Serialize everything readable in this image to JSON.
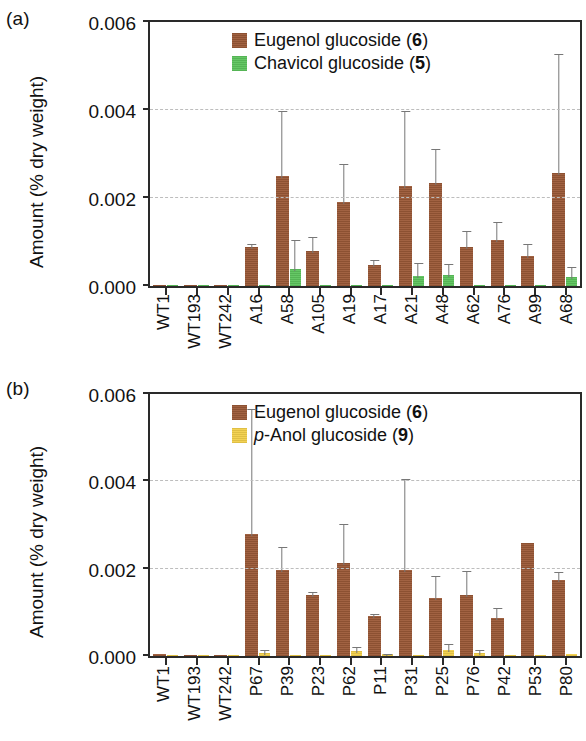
{
  "figure": {
    "panel_a_tag": "(a)",
    "panel_b_tag": "(b)",
    "y_axis_title": "Amount (% dry weight)",
    "x_axis_title": "Lines"
  },
  "chart_data": [
    {
      "type": "bar",
      "panel": "(a)",
      "title": "",
      "xlabel": "",
      "ylabel": "Amount (% dry weight)",
      "ylim": [
        0,
        0.006
      ],
      "yticks": [
        0.0,
        0.002,
        0.004,
        0.006
      ],
      "ytick_labels": [
        "0.000",
        "0.002",
        "0.004",
        "0.006"
      ],
      "grid": true,
      "legend_position": "top-center",
      "categories": [
        "WT1",
        "WT193",
        "WT242",
        "A16",
        "A58",
        "A105",
        "A19",
        "A17",
        "A21",
        "A48",
        "A62",
        "A76",
        "A99",
        "A68"
      ],
      "series": [
        {
          "name": "Eugenol glucoside (6)",
          "color": "#9c5a38",
          "values": [
            2e-05,
            2e-05,
            2e-05,
            0.00088,
            0.0025,
            0.00079,
            0.0019,
            0.00048,
            0.00228,
            0.00234,
            0.00088,
            0.00104,
            0.00069,
            0.00257
          ],
          "errors": [
            0.0,
            0.0,
            0.0,
            0.00012,
            0.00152,
            0.00038,
            0.00093,
            0.00015,
            0.00175,
            0.00083,
            0.00042,
            0.00046,
            0.00031,
            0.00274
          ]
        },
        {
          "name": "Chavicol glucoside (5)",
          "color": "#5cc35c",
          "values": [
            0.0,
            0.0,
            0.0,
            2e-05,
            0.00039,
            2e-05,
            2e-05,
            2e-05,
            0.00022,
            0.00024,
            2e-05,
            2e-05,
            2e-05,
            0.0002
          ],
          "errors": [
            0.0,
            0.0,
            0.0,
            0.0,
            0.0007,
            0.0,
            0.0,
            0.0,
            0.00035,
            0.0003,
            0.0,
            0.0,
            0.0,
            0.00028
          ]
        }
      ]
    },
    {
      "type": "bar",
      "panel": "(b)",
      "title": "",
      "xlabel": "Lines",
      "ylabel": "Amount (% dry weight)",
      "ylim": [
        0,
        0.006
      ],
      "yticks": [
        0.0,
        0.002,
        0.004,
        0.006
      ],
      "ytick_labels": [
        "0.000",
        "0.002",
        "0.004",
        "0.006"
      ],
      "grid": true,
      "legend_position": "top-center",
      "categories": [
        "WT1",
        "WT193",
        "WT242",
        "P67",
        "P39",
        "P23",
        "P62",
        "P11",
        "P31",
        "P25",
        "P76",
        "P42",
        "P53",
        "P80"
      ],
      "series": [
        {
          "name": "Eugenol glucoside (6)",
          "color": "#9c5a38",
          "values": [
            4e-05,
            3e-05,
            3e-05,
            0.00279,
            0.00196,
            0.0014,
            0.00213,
            0.00092,
            0.00196,
            0.00134,
            0.0014,
            0.00088,
            0.00259,
            0.00175
          ],
          "errors": [
            0.0,
            0.0,
            0.0,
            0.00291,
            0.00059,
            0.00012,
            0.00093,
            9e-05,
            0.00213,
            0.00054,
            0.0006,
            0.00026,
            0.0,
            0.00022
          ]
        },
        {
          "name": "p-Anol glucoside (9)",
          "color": "#f2cf4a",
          "values": [
            0.0,
            0.0,
            0.0,
            8e-05,
            3e-05,
            2e-05,
            0.00012,
            5e-05,
            2e-05,
            0.00014,
            8e-05,
            3e-05,
            2e-05,
            5e-05
          ],
          "errors": [
            0.0,
            0.0,
            0.0,
            0.0001,
            0.0,
            0.0,
            0.00014,
            4e-05,
            0.0,
            0.00018,
            0.0001,
            0.0,
            0.0,
            0.0
          ]
        }
      ]
    }
  ]
}
